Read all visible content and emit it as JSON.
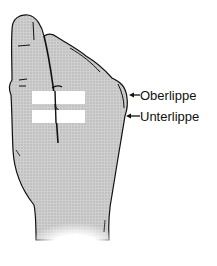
{
  "diagram": {
    "labels": [
      {
        "id": "oberlippe",
        "text": "Oberlippe"
      },
      {
        "id": "unterlippe",
        "text": "Unterlippe"
      }
    ],
    "colors": {
      "fill": "#c8c8c8",
      "outline": "#111111",
      "markers": "#ffffff"
    }
  }
}
